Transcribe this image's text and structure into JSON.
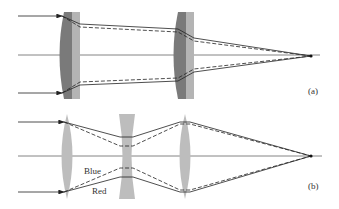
{
  "figure": {
    "panel_a": {
      "label": "(a)",
      "description": "Achromatic doublets focusing parallel rays",
      "lens_colors": {
        "crown": "#7a7a7a",
        "flint": "#b4b4b4"
      }
    },
    "panel_b": {
      "label": "(b)",
      "description": "Converging-diverging-converging lens system separating colors",
      "ray_labels": {
        "blue": "Blue",
        "red": "Red"
      },
      "lens_color": "#bdbdbd"
    },
    "colors": {
      "ray": "#222222",
      "axis": "#555555",
      "background": "#ffffff"
    }
  }
}
